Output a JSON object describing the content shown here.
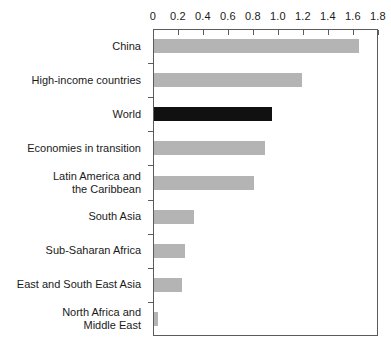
{
  "chart_data": {
    "type": "bar",
    "orientation": "horizontal",
    "title": "",
    "xlabel": "",
    "ylabel": "",
    "xlim": [
      0,
      1.8
    ],
    "xticks": [
      "0",
      "0.2",
      "0.4",
      "0.6",
      "0.8",
      "1.0",
      "1.2",
      "1.4",
      "1.6",
      "1.8"
    ],
    "xtick_values": [
      0,
      0.2,
      0.4,
      0.6,
      0.8,
      1.0,
      1.2,
      1.4,
      1.6,
      1.8
    ],
    "grid": false,
    "legend": "none",
    "categories": [
      "China",
      "High-income countries",
      "World",
      "Economies in transition",
      "Latin America and\nthe Caribbean",
      "South Asia",
      "Sub-Saharan Africa",
      "East and South East Asia",
      "North Africa and\nMiddle East"
    ],
    "values": [
      1.64,
      1.18,
      0.94,
      0.89,
      0.8,
      0.32,
      0.25,
      0.22,
      0.03
    ],
    "highlight_index": 2,
    "colors": {
      "bar": "#b4b4b4",
      "bar_highlight": "#111111",
      "axis": "#5b5b5b",
      "text": "#1a1a1a",
      "background": "#ffffff"
    }
  }
}
